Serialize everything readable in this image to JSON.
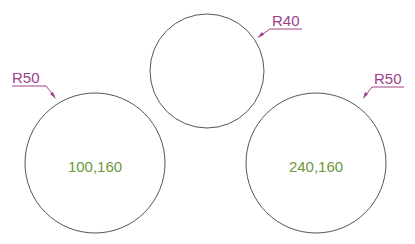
{
  "diagram": {
    "colors": {
      "circle_stroke": "#555555",
      "dimension": "#a0408a",
      "coordinate_text": "#6a9a3a",
      "background": "#ffffff"
    },
    "circles": [
      {
        "id": "left",
        "radius_label": "R50",
        "center_label": "100,160"
      },
      {
        "id": "top",
        "radius_label": "R40"
      },
      {
        "id": "right",
        "radius_label": "R50",
        "center_label": "240,160"
      }
    ]
  }
}
